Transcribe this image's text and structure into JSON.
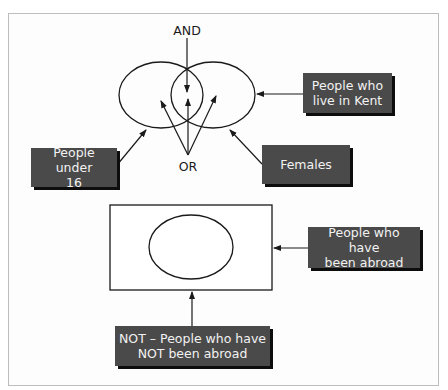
{
  "diagram": {
    "title": "",
    "top_section": {
      "operators": {
        "and_label": "AND",
        "or_label": "OR"
      },
      "sets": [
        {
          "id": "left-set",
          "description": "People under 16"
        },
        {
          "id": "right-set",
          "description": "Females"
        }
      ],
      "labels": {
        "people_under_16": "People under\n16",
        "people_in_kent": "People who\nlive in Kent",
        "females": "Females"
      }
    },
    "bottom_section": {
      "labels": {
        "been_abroad": "People who have\nbeen abroad",
        "not_been_abroad": "NOT – People who have\nNOT been abroad"
      }
    },
    "colors": {
      "label_box_fill": "#4a4a4a",
      "label_box_shadow": "#0d0d0d",
      "label_text": "#f2f2f2",
      "line": "#1a1a1a",
      "frame_border": "#bdbdbd"
    }
  }
}
